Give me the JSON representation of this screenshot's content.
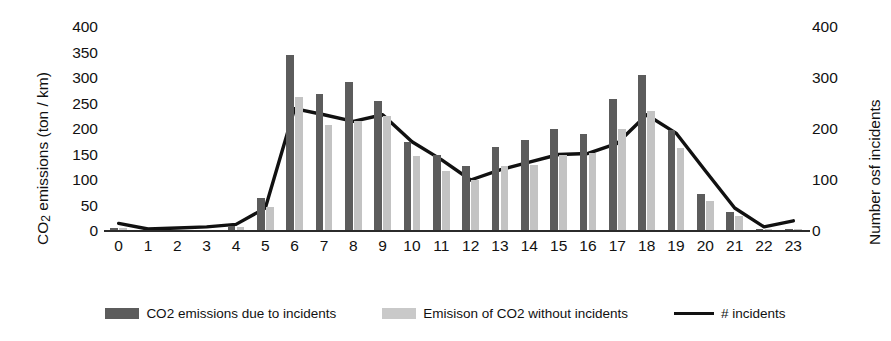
{
  "axes": {
    "y_left": {
      "title_prefix": "CO",
      "title_sub": "2",
      "title_suffix": " emissions (ton / km)",
      "title_full": "CO2 emissions (ton / km)",
      "ticks": [
        "400",
        "350",
        "300",
        "250",
        "200",
        "150",
        "100",
        "50",
        "0"
      ],
      "min": 0,
      "max": 400,
      "step": 50
    },
    "y_right": {
      "title_full": "Number osf incidents",
      "ticks": [
        "400",
        "300",
        "200",
        "100",
        "0"
      ],
      "min": 0,
      "max": 400,
      "step": 100
    },
    "x": {
      "ticks": [
        "0",
        "1",
        "2",
        "3",
        "4",
        "5",
        "6",
        "7",
        "8",
        "9",
        "10",
        "11",
        "12",
        "13",
        "14",
        "15",
        "16",
        "17",
        "18",
        "19",
        "20",
        "21",
        "22",
        "23"
      ]
    }
  },
  "legend": {
    "items": [
      {
        "label": "CO2 emissions due to incidents",
        "marker": "dark-square-swatch",
        "color": "#5c5c5c"
      },
      {
        "label": "Emisison of CO2 without incidents",
        "marker": "light-square-swatch",
        "color": "#c9c9c9"
      },
      {
        "label": "# incidents",
        "marker": "black-line-swatch",
        "color": "#111111"
      }
    ]
  },
  "colors": {
    "bar_with_incidents": "#5c5c5c",
    "bar_without_incidents": "#c3c3c3",
    "line_incidents": "#111111",
    "axis": "#2b2b2b",
    "background": "#ffffff"
  },
  "chart_data": {
    "type": "bar",
    "title": "",
    "subtitle": "",
    "xlabel": "",
    "ylabel": "CO2 emissions (ton / km)",
    "y2label": "Number osf incidents",
    "grid": false,
    "legend_position": "bottom",
    "categories": [
      "0",
      "1",
      "2",
      "3",
      "4",
      "5",
      "6",
      "7",
      "8",
      "9",
      "10",
      "11",
      "12",
      "13",
      "14",
      "15",
      "16",
      "17",
      "18",
      "19",
      "20",
      "21",
      "22",
      "23"
    ],
    "ylim": [
      0,
      400
    ],
    "y2lim": [
      0,
      400
    ],
    "series": [
      {
        "name": "CO2 emissions due to incidents",
        "type": "bar",
        "axis": "left",
        "color": "#5c5c5c",
        "values": [
          6,
          2,
          2,
          2,
          9,
          65,
          345,
          268,
          292,
          255,
          175,
          150,
          128,
          165,
          178,
          200,
          190,
          258,
          305,
          198,
          72,
          38,
          4,
          4
        ]
      },
      {
        "name": "Emisison of CO2 without incidents",
        "type": "bar",
        "axis": "left",
        "color": "#c3c3c3",
        "values": [
          5,
          2,
          2,
          2,
          7,
          48,
          262,
          208,
          215,
          225,
          148,
          118,
          100,
          128,
          130,
          150,
          152,
          200,
          235,
          162,
          58,
          30,
          3,
          3
        ]
      },
      {
        "name": "# incidents",
        "type": "line",
        "axis": "right",
        "color": "#111111",
        "values": [
          15,
          4,
          6,
          8,
          13,
          45,
          240,
          228,
          215,
          228,
          175,
          140,
          100,
          120,
          135,
          150,
          152,
          172,
          228,
          192,
          118,
          45,
          8,
          20
        ]
      }
    ]
  }
}
